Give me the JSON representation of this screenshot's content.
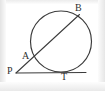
{
  "figure": {
    "kind": "geometry-diagram",
    "background_color": "#ffffff",
    "stroke_color": "#3b3b3b",
    "label_color": "#2f2f2f",
    "circle": {
      "center_x": 61,
      "center_y": 41.5,
      "radius": 30.5
    },
    "segments": [
      {
        "name": "secant-PB",
        "x1": 16,
        "y1": 73,
        "x2": 79.5,
        "y2": 14.5
      },
      {
        "name": "tangent-PT",
        "x1": 16,
        "y1": 73,
        "x2": 86,
        "y2": 72.5
      }
    ],
    "labels": [
      {
        "id": "P",
        "text": "P",
        "x": 7,
        "y": 66
      },
      {
        "id": "A",
        "text": "A",
        "x": 22,
        "y": 51
      },
      {
        "id": "B",
        "text": "B",
        "x": 75,
        "y": 3
      },
      {
        "id": "T",
        "text": "T",
        "x": 61,
        "y": 72
      }
    ]
  }
}
